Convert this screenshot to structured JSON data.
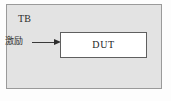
{
  "diagram": {
    "title": "TB",
    "container": {
      "label": "TB",
      "fill_color": "#e3e3e3",
      "border_color": "#9a9a9a"
    },
    "stimulus": {
      "label": "激励",
      "arrow_name": "stimulus-arrow",
      "arrow_color": "#2e2e2e",
      "direction": "right"
    },
    "dut": {
      "label": "DUT",
      "fill_color": "#ffffff",
      "border_color": "#5f5f5f"
    },
    "background_color": "#fdfdfd"
  }
}
